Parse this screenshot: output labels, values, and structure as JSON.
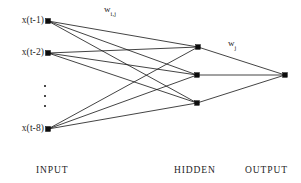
{
  "figure": {
    "type": "neural-network-diagram",
    "background_color": "#ffffff",
    "line_color": "#141414",
    "node_color": "#0d0d0d",
    "text_color": "#1f1f1f"
  },
  "layers": {
    "input": {
      "caption": "INPUT",
      "nodes": [
        {
          "label": "x(t-1)",
          "x": 48,
          "y": 21
        },
        {
          "label": "x(t-2)",
          "x": 48,
          "y": 53
        },
        {
          "label": "x(t-8)",
          "x": 48,
          "y": 129
        }
      ],
      "ellipsis": {
        "x": 44,
        "y": 85,
        "count": 3
      }
    },
    "hidden": {
      "caption": "HIDDEN",
      "nodes": [
        {
          "label": "",
          "x": 198,
          "y": 47
        },
        {
          "label": "",
          "x": 197,
          "y": 75
        },
        {
          "label": "",
          "x": 197,
          "y": 103
        }
      ]
    },
    "output": {
      "caption": "OUTPUT",
      "nodes": [
        {
          "label": "",
          "x": 285,
          "y": 75
        }
      ]
    }
  },
  "weights": {
    "input_to_hidden": {
      "base": "w",
      "subscript": "i,j",
      "x": 104,
      "y": 5
    },
    "hidden_to_output": {
      "base": "w",
      "subscript": "j",
      "x": 228,
      "y": 39
    }
  },
  "captions": {
    "input": {
      "text": "INPUT",
      "x": 36,
      "y": 166
    },
    "hidden": {
      "text": "HIDDEN",
      "x": 174,
      "y": 166
    },
    "output": {
      "text": "OUTPUT",
      "x": 245,
      "y": 166
    }
  },
  "chart_data": {
    "type": "diagram",
    "layer_sizes": {
      "input": 8,
      "hidden": 3,
      "output": 1
    },
    "input_labels": [
      "x(t-1)",
      "x(t-2)",
      "x(t-8)"
    ],
    "edges_input_hidden": 9,
    "edges_hidden_output": 3
  }
}
